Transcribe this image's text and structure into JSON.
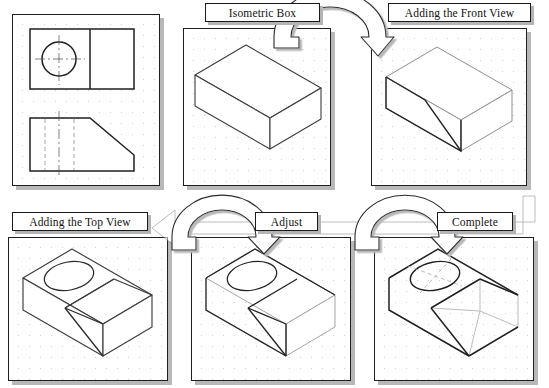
{
  "figure": {
    "type": "technical-drawing-tutorial",
    "background": "#ffffff",
    "line_color": "#1f1f1f",
    "construction_line_color": "#b9b9b9",
    "shadow_color": "#b8b8b8",
    "grid_dot_color": "#c9c9c9"
  },
  "panels": [
    {
      "id": "orthographic-views",
      "label": "",
      "has_label": false,
      "x": 12,
      "y": 14,
      "w": 148,
      "h": 172,
      "contents": "top view with circular hole and centerlines; front view with angled cut and hidden lines"
    },
    {
      "id": "isometric-box",
      "label": "Isometric Box",
      "has_label": true,
      "label_x": 205,
      "label_y": 3,
      "label_w": 115,
      "label_h": 19,
      "x": 183,
      "y": 28,
      "w": 148,
      "h": 158,
      "contents": "plain isometric rectangular box"
    },
    {
      "id": "adding-the-front-view",
      "label": "Adding the Front View",
      "has_label": true,
      "label_x": 388,
      "label_y": 3,
      "label_w": 143,
      "label_h": 19,
      "x": 371,
      "y": 28,
      "w": 156,
      "h": 158,
      "contents": "isometric box with inclined front-view cut line drawn on left face"
    },
    {
      "id": "adding-the-top-view",
      "label": "Adding the Top View",
      "has_label": true,
      "label_x": 12,
      "label_y": 212,
      "label_w": 136,
      "label_h": 19,
      "x": 8,
      "y": 237,
      "w": 160,
      "h": 144,
      "contents": "isometric box with top-face ellipse hole and dividing edge added"
    },
    {
      "id": "adjust",
      "label": "Adjust",
      "has_label": true,
      "label_x": 255,
      "label_y": 212,
      "label_w": 63,
      "label_h": 19,
      "x": 191,
      "y": 237,
      "w": 160,
      "h": 144,
      "contents": "construction refined, excess lines lightened"
    },
    {
      "id": "complete",
      "label": "Complete",
      "has_label": true,
      "label_x": 437,
      "label_y": 212,
      "label_w": 76,
      "label_h": 19,
      "x": 374,
      "y": 237,
      "w": 160,
      "h": 144,
      "contents": "finished solid with inclined face, hole and isometric centerlines; construction box shown light gray"
    }
  ],
  "arrows": [
    {
      "id": "arrow-box-to-front",
      "from": "isometric-box",
      "to": "adding-the-front-view",
      "shape": "u-turn-curved",
      "direction": "right"
    },
    {
      "id": "arrow-front-to-top",
      "from": "adding-the-front-view",
      "to": "adding-the-top-view",
      "shape": "wrap-around",
      "direction": "down-left"
    },
    {
      "id": "arrow-top-to-adjust",
      "from": "adding-the-top-view",
      "to": "adjust",
      "shape": "u-turn-curved",
      "direction": "right"
    },
    {
      "id": "arrow-adjust-to-complete",
      "from": "adjust",
      "to": "complete",
      "shape": "u-turn-curved",
      "direction": "right"
    }
  ],
  "orthographic": {
    "top_view": {
      "hole": "circle",
      "centerlines": "horizontal and vertical",
      "divider": "vertical line right of hole"
    },
    "front_view": {
      "profile": "rectangle with upper-right chamfer",
      "hidden_lines": 2,
      "centerline": 1
    }
  }
}
